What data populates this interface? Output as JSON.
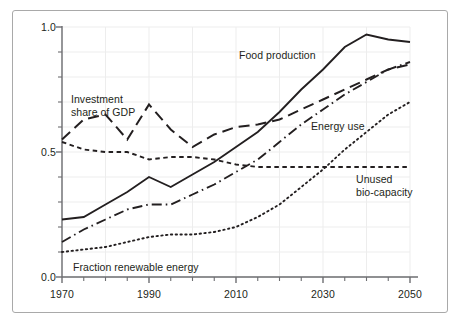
{
  "figure": {
    "background_color": "#ffffff",
    "frame_color": "#a9a9a9",
    "ink_color": "#231f20",
    "grid_color": "#ededed"
  },
  "chart_data": {
    "type": "line",
    "title": "",
    "xlabel": "",
    "ylabel": "",
    "xlim": [
      1970,
      2050
    ],
    "ylim": [
      0.0,
      1.0
    ],
    "grid": true,
    "legend_position": "inline-annotations",
    "x_ticks_major": [
      1970,
      1990,
      2010,
      2030,
      2050
    ],
    "x_tick_labels": [
      "1970",
      "1990",
      "2010",
      "2030",
      "2050"
    ],
    "x_ticks_minor_step": 5,
    "y_ticks_major": [
      0.0,
      0.5,
      1.0
    ],
    "y_tick_labels": [
      "0.0",
      "0.5",
      "1.0"
    ],
    "y_ticks_minor_step": 0.1,
    "series": [
      {
        "name": "Food production",
        "style": "solid",
        "x": [
          1970,
          1975,
          1980,
          1985,
          1990,
          1995,
          2000,
          2005,
          2010,
          2015,
          2020,
          2025,
          2030,
          2035,
          2040,
          2045,
          2050
        ],
        "values": [
          0.23,
          0.24,
          0.29,
          0.34,
          0.4,
          0.36,
          0.41,
          0.46,
          0.52,
          0.58,
          0.66,
          0.75,
          0.83,
          0.92,
          0.97,
          0.95,
          0.94
        ]
      },
      {
        "name": "Investment share of GDP",
        "style": "long-dash",
        "x": [
          1970,
          1975,
          1980,
          1985,
          1990,
          1995,
          2000,
          2005,
          2010,
          2015,
          2020,
          2025,
          2030,
          2035,
          2040,
          2045,
          2050
        ],
        "values": [
          0.55,
          0.63,
          0.65,
          0.55,
          0.69,
          0.59,
          0.52,
          0.57,
          0.6,
          0.61,
          0.63,
          0.67,
          0.71,
          0.75,
          0.79,
          0.83,
          0.85
        ]
      },
      {
        "name": "Unused bio-capacity",
        "style": "short-dash",
        "x": [
          1970,
          1975,
          1980,
          1985,
          1990,
          1995,
          2000,
          2005,
          2010,
          2015,
          2020,
          2025,
          2030,
          2035,
          2040,
          2045,
          2050
        ],
        "values": [
          0.54,
          0.51,
          0.5,
          0.5,
          0.47,
          0.48,
          0.48,
          0.47,
          0.45,
          0.44,
          0.44,
          0.44,
          0.44,
          0.44,
          0.44,
          0.44,
          0.44
        ]
      },
      {
        "name": "Energy use",
        "style": "dash-dot",
        "x": [
          1970,
          1975,
          1980,
          1985,
          1990,
          1995,
          2000,
          2005,
          2010,
          2015,
          2020,
          2025,
          2030,
          2035,
          2040,
          2045,
          2050
        ],
        "values": [
          0.14,
          0.19,
          0.23,
          0.27,
          0.29,
          0.29,
          0.33,
          0.37,
          0.42,
          0.47,
          0.54,
          0.61,
          0.67,
          0.73,
          0.78,
          0.83,
          0.86
        ]
      },
      {
        "name": "Fraction renewable energy",
        "style": "dotted",
        "x": [
          1970,
          1975,
          1980,
          1985,
          1990,
          1995,
          2000,
          2005,
          2010,
          2015,
          2020,
          2025,
          2030,
          2035,
          2040,
          2045,
          2050
        ],
        "values": [
          0.1,
          0.11,
          0.12,
          0.14,
          0.16,
          0.17,
          0.17,
          0.18,
          0.2,
          0.24,
          0.29,
          0.36,
          0.43,
          0.51,
          0.58,
          0.65,
          0.7
        ]
      }
    ],
    "annotations": [
      {
        "text": "Food production",
        "series": "Food production"
      },
      {
        "text_line1": "Investment",
        "text_line2": "share of GDP",
        "series": "Investment share of GDP"
      },
      {
        "text": "Energy use",
        "series": "Energy use"
      },
      {
        "text_line1": "Unused",
        "text_line2": "bio-capacity",
        "series": "Unused bio-capacity"
      },
      {
        "text": "Fraction renewable energy",
        "series": "Fraction renewable energy"
      }
    ]
  },
  "labels": {
    "y_0": "0.0",
    "y_5": "0.5",
    "y_10": "1.0",
    "x_1970": "1970",
    "x_1990": "1990",
    "x_2010": "2010",
    "x_2030": "2030",
    "x_2050": "2050",
    "food_production": "Food production",
    "investment_l1": "Investment",
    "investment_l2": "share of GDP",
    "energy_use": "Energy use",
    "unused_l1": "Unused",
    "unused_l2": "bio-capacity",
    "fraction_renewable": "Fraction renewable energy"
  }
}
